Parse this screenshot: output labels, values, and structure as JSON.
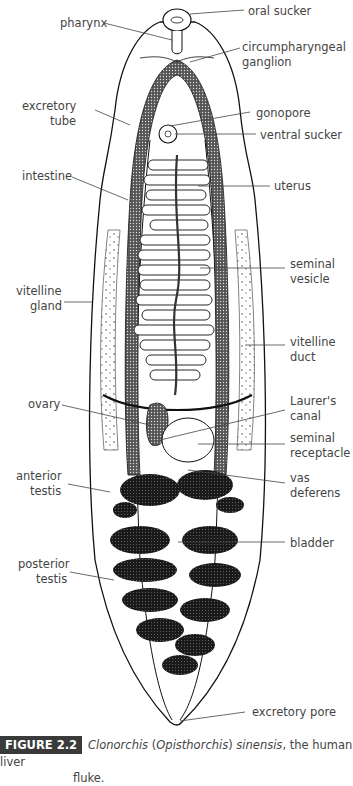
{
  "figure": {
    "number_label": "FIGURE 2.2",
    "caption_parts": [
      {
        "text": "Clonorchis",
        "italic": true
      },
      {
        "text": " (",
        "italic": false
      },
      {
        "text": "Opisthorchis",
        "italic": true
      },
      {
        "text": ") ",
        "italic": false
      },
      {
        "text": "sinensis",
        "italic": true
      },
      {
        "text": ", the human liver",
        "italic": false
      }
    ],
    "caption_line2": "fluke."
  },
  "labels": {
    "oral_sucker": "oral sucker",
    "pharynx": "pharynx",
    "circumpharyngeal_1": "circumpharyngeal",
    "circumpharyngeal_2": "ganglion",
    "excretory_tube_1": "excretory",
    "excretory_tube_2": "tube",
    "gonopore": "gonopore",
    "ventral_sucker": "ventral sucker",
    "intestine": "intestine",
    "uterus": "uterus",
    "seminal_vesicle_1": "seminal",
    "seminal_vesicle_2": "vesicle",
    "vitelline_gland_1": "vitelline",
    "vitelline_gland_2": "gland",
    "vitelline_duct_1": "vitelline",
    "vitelline_duct_2": "duct",
    "ovary": "ovary",
    "laurers_canal_1": "Laurer's",
    "laurers_canal_2": "canal",
    "seminal_receptacle_1": "seminal",
    "seminal_receptacle_2": "receptacle",
    "anterior_testis_1": "anterior",
    "anterior_testis_2": "testis",
    "vas_deferens_1": "vas",
    "vas_deferens_2": "deferens",
    "bladder": "bladder",
    "posterior_testis_1": "posterior",
    "posterior_testis_2": "testis",
    "excretory_pore": "excretory pore"
  }
}
